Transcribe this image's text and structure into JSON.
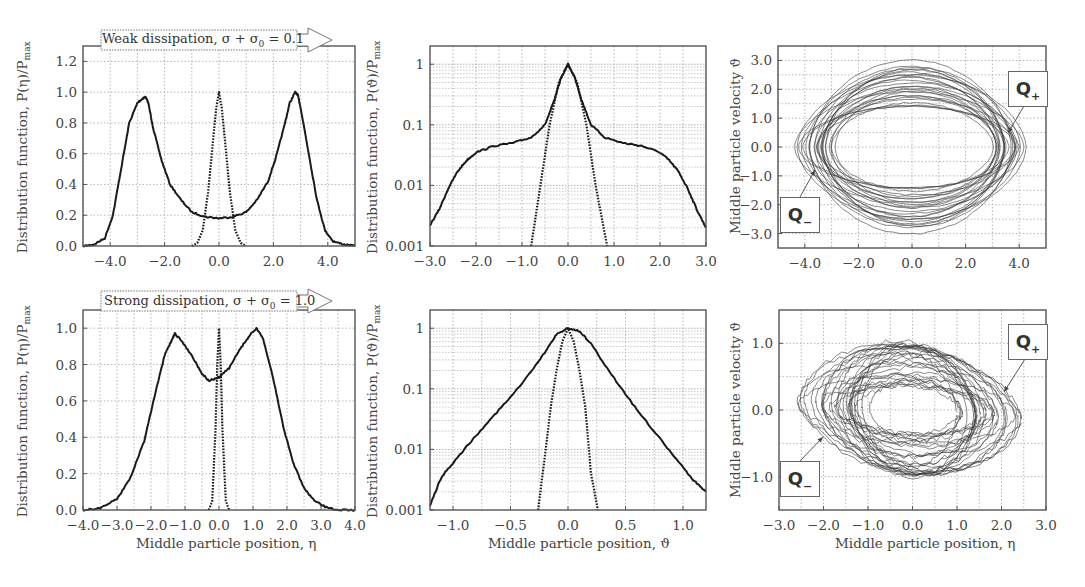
{
  "chart_data": [
    {
      "id": "p1",
      "type": "line",
      "row": "weak",
      "annotation": "Weak dissipation, σ + σ₀ = 0.1",
      "xlabel": "",
      "ylabel": "Distribution function, P(η)/P_max",
      "xlim": [
        -5,
        5
      ],
      "ylim": [
        0,
        1.3
      ],
      "yscale": "linear",
      "xticks": [
        -4,
        -2,
        0,
        2,
        4
      ],
      "xtick_labels": [
        "−4.0",
        "−2.0",
        "0.0",
        "2.0",
        "4.0"
      ],
      "yticks": [
        0,
        0.2,
        0.4,
        0.6,
        0.8,
        1.0,
        1.2
      ],
      "ytick_labels": [
        "0.0",
        "0.2",
        "0.4",
        "0.6",
        "0.8",
        "1.0",
        "1.2"
      ],
      "grid": true,
      "series": [
        {
          "name": "solid",
          "style": "solid",
          "x": [
            -5,
            -4.6,
            -4.2,
            -3.9,
            -3.6,
            -3.3,
            -3.0,
            -2.8,
            -2.7,
            -2.6,
            -2.4,
            -2.1,
            -1.8,
            -1.4,
            -1.0,
            -0.5,
            0,
            0.5,
            1.0,
            1.4,
            1.8,
            2.1,
            2.4,
            2.6,
            2.8,
            2.9,
            3.0,
            3.3,
            3.6,
            3.9,
            4.2,
            4.6,
            5
          ],
          "y": [
            0,
            0.01,
            0.05,
            0.2,
            0.5,
            0.8,
            0.93,
            0.96,
            0.97,
            0.93,
            0.75,
            0.55,
            0.4,
            0.3,
            0.22,
            0.19,
            0.18,
            0.19,
            0.22,
            0.3,
            0.42,
            0.58,
            0.78,
            0.93,
            1.0,
            0.98,
            0.9,
            0.6,
            0.3,
            0.1,
            0.03,
            0.01,
            0
          ]
        },
        {
          "name": "dotted",
          "style": "dotted",
          "x": [
            -1.0,
            -0.8,
            -0.6,
            -0.4,
            -0.2,
            -0.1,
            0,
            0.1,
            0.2,
            0.4,
            0.6,
            0.8,
            1.0
          ],
          "y": [
            0,
            0.02,
            0.1,
            0.35,
            0.72,
            0.9,
            1.0,
            0.9,
            0.72,
            0.35,
            0.1,
            0.02,
            0
          ]
        }
      ]
    },
    {
      "id": "p2",
      "type": "line",
      "row": "weak",
      "xlabel": "",
      "ylabel": "Distribution function, P(ϑ)/P_max",
      "xlim": [
        -3,
        3
      ],
      "ylim": [
        0.001,
        2
      ],
      "yscale": "log",
      "xticks": [
        -3,
        -2,
        -1,
        0,
        1,
        2,
        3
      ],
      "xtick_labels": [
        "−3.0",
        "−2.0",
        "−1.0",
        "0.0",
        "1.0",
        "2.0",
        "3.0"
      ],
      "yticks": [
        0.001,
        0.01,
        0.1,
        1
      ],
      "ytick_labels": [
        "0.001",
        "0.01",
        "0.1",
        "1"
      ],
      "grid": true,
      "series": [
        {
          "name": "solid",
          "style": "solid",
          "x": [
            -3,
            -2.8,
            -2.6,
            -2.4,
            -2.2,
            -2.0,
            -1.6,
            -1.2,
            -0.8,
            -0.5,
            -0.3,
            -0.15,
            0,
            0.15,
            0.3,
            0.5,
            0.8,
            1.2,
            1.6,
            2.0,
            2.2,
            2.4,
            2.6,
            2.8,
            3
          ],
          "y": [
            0.0022,
            0.004,
            0.009,
            0.017,
            0.026,
            0.035,
            0.045,
            0.05,
            0.062,
            0.1,
            0.25,
            0.6,
            1.0,
            0.6,
            0.25,
            0.1,
            0.062,
            0.05,
            0.045,
            0.035,
            0.026,
            0.017,
            0.009,
            0.004,
            0.002
          ]
        },
        {
          "name": "dotted",
          "style": "dotted",
          "x": [
            -0.8,
            -0.6,
            -0.4,
            -0.2,
            0,
            0.2,
            0.4,
            0.6,
            0.85
          ],
          "y": [
            0.001,
            0.01,
            0.1,
            0.5,
            1.0,
            0.5,
            0.1,
            0.01,
            0.001
          ]
        }
      ]
    },
    {
      "id": "p3",
      "type": "scatter",
      "row": "weak",
      "subtype": "phase-portrait",
      "xlabel": "",
      "ylabel": "Middle particle velocity ϑ",
      "xlim": [
        -5,
        5
      ],
      "ylim": [
        -3.5,
        3.5
      ],
      "yscale": "linear",
      "xticks": [
        -4,
        -2,
        0,
        2,
        4
      ],
      "xtick_labels": [
        "−4.0",
        "−2.0",
        "0.0",
        "2.0",
        "4.0"
      ],
      "yticks": [
        -3,
        -2,
        -1,
        0,
        1,
        2,
        3
      ],
      "ytick_labels": [
        "−3.0",
        "−2.0",
        "−1.0",
        "0.0",
        "1.0",
        "2.0",
        "3.0"
      ],
      "grid": true,
      "annotations": [
        {
          "text": "Q+",
          "points_to": [
            3.5,
            0.5
          ]
        },
        {
          "text": "Q−",
          "points_to": [
            -3.5,
            -0.7
          ]
        }
      ],
      "orbits": {
        "count": 26,
        "x_amp_min": 3.0,
        "x_amp_max": 4.3,
        "v_amp_min": 1.3,
        "v_amp_max": 3.1,
        "x_center": 0.0
      }
    },
    {
      "id": "p4",
      "type": "line",
      "row": "strong",
      "annotation": "Strong dissipation, σ + σ₀ = 1.0",
      "xlabel": "Middle particle position, η",
      "ylabel": "Distribution function, P(η)/P_max",
      "xlim": [
        -4,
        4
      ],
      "ylim": [
        0,
        1.1
      ],
      "yscale": "linear",
      "xticks": [
        -4,
        -3,
        -2,
        -1,
        0,
        1,
        2,
        3,
        4
      ],
      "xtick_labels": [
        "−4.0",
        "−3.0",
        "−2.0",
        "−1.0",
        "0.0",
        "1.0",
        "2.0",
        "3.0",
        "4.0"
      ],
      "yticks": [
        0,
        0.2,
        0.4,
        0.6,
        0.8,
        1.0
      ],
      "ytick_labels": [
        "0.0",
        "0.2",
        "0.4",
        "0.6",
        "0.8",
        "1.0"
      ],
      "grid": true,
      "series": [
        {
          "name": "solid",
          "style": "solid",
          "x": [
            -4,
            -3.5,
            -3.0,
            -2.6,
            -2.2,
            -1.9,
            -1.6,
            -1.4,
            -1.3,
            -1.1,
            -0.8,
            -0.5,
            -0.3,
            0,
            0.3,
            0.6,
            0.9,
            1.1,
            1.3,
            1.6,
            1.9,
            2.2,
            2.5,
            2.8,
            3.2,
            3.6,
            4
          ],
          "y": [
            0,
            0.01,
            0.06,
            0.18,
            0.38,
            0.62,
            0.85,
            0.93,
            0.97,
            0.93,
            0.85,
            0.75,
            0.71,
            0.73,
            0.78,
            0.88,
            0.96,
            1.0,
            0.94,
            0.72,
            0.45,
            0.25,
            0.12,
            0.05,
            0.01,
            0,
            0
          ]
        },
        {
          "name": "dotted",
          "style": "dotted",
          "x": [
            -0.3,
            -0.2,
            -0.1,
            -0.05,
            0,
            0.05,
            0.1,
            0.2,
            0.3
          ],
          "y": [
            0,
            0.05,
            0.45,
            0.8,
            1.0,
            0.8,
            0.45,
            0.05,
            0
          ]
        }
      ]
    },
    {
      "id": "p5",
      "type": "line",
      "row": "strong",
      "xlabel": "Middle particle position, ϑ",
      "ylabel": "Distribution function, P(ϑ)/P_max",
      "xlim": [
        -1.2,
        1.2
      ],
      "ylim": [
        0.001,
        2
      ],
      "yscale": "log",
      "xticks": [
        -1,
        -0.5,
        0,
        0.5,
        1
      ],
      "xtick_labels": [
        "−1.0",
        "−0.5",
        "0.0",
        "0.5",
        "1.0"
      ],
      "yticks": [
        0.001,
        0.01,
        0.1,
        1
      ],
      "ytick_labels": [
        "0.001",
        "0.01",
        "0.1",
        "1"
      ],
      "grid": true,
      "series": [
        {
          "name": "solid",
          "style": "solid",
          "x": [
            -1.2,
            -1.1,
            -1.0,
            -0.8,
            -0.6,
            -0.4,
            -0.2,
            -0.1,
            0,
            0.1,
            0.2,
            0.4,
            0.6,
            0.8,
            1.0,
            1.1,
            1.2
          ],
          "y": [
            0.0012,
            0.0035,
            0.006,
            0.017,
            0.045,
            0.12,
            0.4,
            0.8,
            1.0,
            0.9,
            0.55,
            0.15,
            0.045,
            0.015,
            0.005,
            0.003,
            0.002
          ]
        },
        {
          "name": "dotted",
          "style": "dotted",
          "x": [
            -0.26,
            -0.2,
            -0.15,
            -0.1,
            -0.05,
            0,
            0.05,
            0.1,
            0.15,
            0.2,
            0.26
          ],
          "y": [
            0.001,
            0.008,
            0.05,
            0.2,
            0.6,
            1.0,
            0.6,
            0.2,
            0.05,
            0.004,
            0.001
          ]
        }
      ]
    },
    {
      "id": "p6",
      "type": "scatter",
      "row": "strong",
      "subtype": "phase-portrait",
      "xlabel": "Middle particle position, η",
      "ylabel": "Middle particle velocity ϑ",
      "xlim": [
        -3,
        3
      ],
      "ylim": [
        -1.5,
        1.5
      ],
      "yscale": "linear",
      "xticks": [
        -3,
        -2,
        -1,
        0,
        1,
        2,
        3
      ],
      "xtick_labels": [
        "−3.0",
        "−2.0",
        "−1.0",
        "0.0",
        "1.0",
        "2.0",
        "3.0"
      ],
      "yticks": [
        -1,
        0,
        1
      ],
      "ytick_labels": [
        "−1.0",
        "0.0",
        "1.0"
      ],
      "grid": true,
      "annotations": [
        {
          "text": "Q+",
          "points_to": [
            2.0,
            0.3
          ]
        },
        {
          "text": "Q−",
          "points_to": [
            -2.0,
            -0.4
          ]
        }
      ],
      "orbits": {
        "count": 30,
        "x_amp_min": 1.0,
        "x_amp_max": 2.6,
        "v_amp_min": 0.3,
        "v_amp_max": 1.05,
        "x_center": 0.0,
        "tilt": -0.25
      }
    }
  ],
  "labels": {
    "weak_annotation": "Weak dissipation, σ + σ",
    "weak_annotation_sub": "0",
    "weak_annotation_tail": " = 0.1",
    "strong_annotation": "Strong dissipation, σ + σ",
    "strong_annotation_sub": "0",
    "strong_annotation_tail": " = 1.0",
    "ylabel_eta": "Distribution function, P(η)/P",
    "ylabel_theta": "Distribution function, P(ϑ)/P",
    "ylabel_sub": "max",
    "ylabel_velocity": "Middle particle velocity ϑ",
    "xlabel_eta": "Middle particle position, η",
    "xlabel_theta": "Middle particle position, ϑ",
    "q_plus": "Q",
    "q_plus_sub": "+",
    "q_minus": "Q",
    "q_minus_sub": "−"
  },
  "colors": {
    "line": "#1a1a1a",
    "grid": "#9a9a9a",
    "frame": "#555555",
    "orbit": "#3a3a3a"
  }
}
